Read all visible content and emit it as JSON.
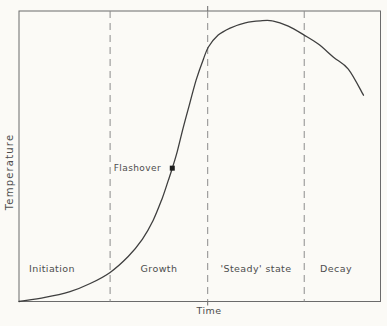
{
  "figure": {
    "ylabel": "Temperature",
    "xlabel": "Time",
    "flashover_label": "Flashover",
    "phase_labels": [
      "Initiation",
      "Growth",
      "'Steady' state",
      "Decay"
    ]
  },
  "chart_data": {
    "type": "line",
    "title": "",
    "xlabel": "Time",
    "ylabel": "Temperature",
    "axes_qualitative": true,
    "x_axis_ticks": [],
    "y_axis_ticks": [],
    "grid": false,
    "legend": false,
    "frame": true,
    "colors": {
      "curve": "#3f3f3f",
      "frame": "#6b6b6b",
      "divider": "#8c8c8c",
      "marker": "#1d1d1d",
      "background": "#fbfaf6"
    },
    "phases": [
      {
        "label": "Initiation",
        "x_start": 0.0,
        "x_end": 0.252
      },
      {
        "label": "Growth",
        "x_start": 0.252,
        "x_end": 0.522
      },
      {
        "label": "'Steady' state",
        "x_start": 0.522,
        "x_end": 0.789
      },
      {
        "label": "Decay",
        "x_start": 0.789,
        "x_end": 1.0
      }
    ],
    "annotations": [
      {
        "label": "Flashover",
        "x": 0.424,
        "y": 0.459,
        "marker": "square"
      }
    ],
    "series": [
      {
        "name": "Temperature",
        "points": [
          [
            0.0,
            0.0
          ],
          [
            0.072,
            0.014
          ],
          [
            0.141,
            0.034
          ],
          [
            0.197,
            0.062
          ],
          [
            0.252,
            0.1
          ],
          [
            0.302,
            0.155
          ],
          [
            0.341,
            0.214
          ],
          [
            0.371,
            0.279
          ],
          [
            0.396,
            0.355
          ],
          [
            0.413,
            0.417
          ],
          [
            0.424,
            0.459
          ],
          [
            0.438,
            0.517
          ],
          [
            0.454,
            0.597
          ],
          [
            0.471,
            0.676
          ],
          [
            0.49,
            0.762
          ],
          [
            0.51,
            0.834
          ],
          [
            0.524,
            0.876
          ],
          [
            0.551,
            0.917
          ],
          [
            0.584,
            0.941
          ],
          [
            0.626,
            0.959
          ],
          [
            0.668,
            0.966
          ],
          [
            0.701,
            0.966
          ],
          [
            0.745,
            0.948
          ],
          [
            0.789,
            0.917
          ],
          [
            0.828,
            0.886
          ],
          [
            0.87,
            0.841
          ],
          [
            0.911,
            0.8
          ],
          [
            0.953,
            0.71
          ]
        ]
      }
    ]
  }
}
